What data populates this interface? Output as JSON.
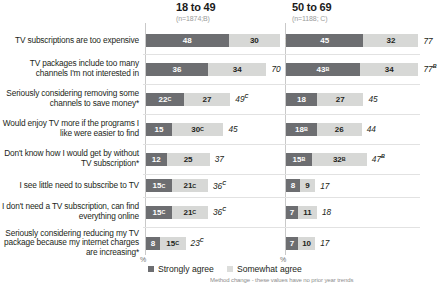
{
  "columns": [
    {
      "title": "18 to 49",
      "n_label": "(n=1874;B)"
    },
    {
      "title": "50 to 69",
      "n_label": "(n=1188; C)"
    }
  ],
  "legend": [
    {
      "label": "Strongly agree",
      "color": "#6d6e71"
    },
    {
      "label": "Somewhat agree",
      "color": "#dcdddb"
    }
  ],
  "axis_pct_a": "%",
  "axis_pct_b": "%",
  "footnote": "Method change - these values have no prior year trends",
  "chart_data": {
    "type": "bar",
    "title": "",
    "xlabel": "%",
    "ylabel": "",
    "orientation": "horizontal",
    "stacked": true,
    "grid": false,
    "legend_position": "bottom-left",
    "xlim": [
      0,
      100
    ],
    "categories": [
      "TV subscriptions are too expensive",
      "TV packages include too many channels I'm not interested in",
      "Seriously considering removing some channels to save money*",
      "Would enjoy TV more if the programs I like were easier to find",
      "Don't know how I would get by without TV subscription*",
      "I see little need to subscribe to TV",
      "I don't need a TV subscription, can find everything online",
      "Seriously considering reducing my TV package because my internet charges are increasing*"
    ],
    "groups": [
      "18 to 49",
      "50 to 69"
    ],
    "series": [
      {
        "name": "Strongly agree",
        "color": "#6d6e71"
      },
      {
        "name": "Somewhat agree",
        "color": "#d7d8d6"
      }
    ],
    "rows": [
      {
        "label": "TV subscriptions are too expensive",
        "a": {
          "strong": 48,
          "strong_sup": "",
          "somewhat": 30,
          "somewhat_sup": "",
          "total": 78,
          "total_sup": ""
        },
        "b": {
          "strong": 45,
          "strong_sup": "",
          "somewhat": 32,
          "somewhat_sup": "",
          "total": 77,
          "total_sup": ""
        }
      },
      {
        "label": "TV packages include too many channels I'm not interested in",
        "a": {
          "strong": 36,
          "strong_sup": "",
          "somewhat": 34,
          "somewhat_sup": "",
          "total": 70,
          "total_sup": ""
        },
        "b": {
          "strong": 43,
          "strong_sup": "B",
          "somewhat": 34,
          "somewhat_sup": "",
          "total": 77,
          "total_sup": "B"
        }
      },
      {
        "label": "Seriously considering removing some channels to save money*",
        "a": {
          "strong": 22,
          "strong_sup": "C",
          "somewhat": 27,
          "somewhat_sup": "",
          "total": 49,
          "total_sup": "C"
        },
        "b": {
          "strong": 18,
          "strong_sup": "",
          "somewhat": 27,
          "somewhat_sup": "",
          "total": 45,
          "total_sup": ""
        }
      },
      {
        "label": "Would enjoy TV more if the programs I like were easier to find",
        "a": {
          "strong": 15,
          "strong_sup": "",
          "somewhat": 30,
          "somewhat_sup": "C",
          "total": 45,
          "total_sup": ""
        },
        "b": {
          "strong": 18,
          "strong_sup": "B",
          "somewhat": 26,
          "somewhat_sup": "",
          "total": 44,
          "total_sup": ""
        }
      },
      {
        "label": "Don't know how I would get by without TV subscription*",
        "a": {
          "strong": 12,
          "strong_sup": "",
          "somewhat": 25,
          "somewhat_sup": "",
          "total": 37,
          "total_sup": ""
        },
        "b": {
          "strong": 15,
          "strong_sup": "B",
          "somewhat": 32,
          "somewhat_sup": "B",
          "total": 47,
          "total_sup": "B"
        }
      },
      {
        "label": "I see little need to subscribe to TV",
        "a": {
          "strong": 15,
          "strong_sup": "C",
          "somewhat": 21,
          "somewhat_sup": "C",
          "total": 36,
          "total_sup": "C"
        },
        "b": {
          "strong": 8,
          "strong_sup": "",
          "somewhat": 9,
          "somewhat_sup": "",
          "total": 17,
          "total_sup": ""
        }
      },
      {
        "label": "I don't need a TV subscription, can find everything online",
        "a": {
          "strong": 15,
          "strong_sup": "C",
          "somewhat": 21,
          "somewhat_sup": "C",
          "total": 36,
          "total_sup": "C"
        },
        "b": {
          "strong": 7,
          "strong_sup": "",
          "somewhat": 11,
          "somewhat_sup": "",
          "total": 18,
          "total_sup": ""
        }
      },
      {
        "label": "Seriously considering reducing my TV package because my internet charges are increasing*",
        "a": {
          "strong": 8,
          "strong_sup": "",
          "somewhat": 15,
          "somewhat_sup": "C",
          "total": 23,
          "total_sup": "C"
        },
        "b": {
          "strong": 7,
          "strong_sup": "",
          "somewhat": 10,
          "somewhat_sup": "",
          "total": 17,
          "total_sup": ""
        }
      }
    ]
  }
}
